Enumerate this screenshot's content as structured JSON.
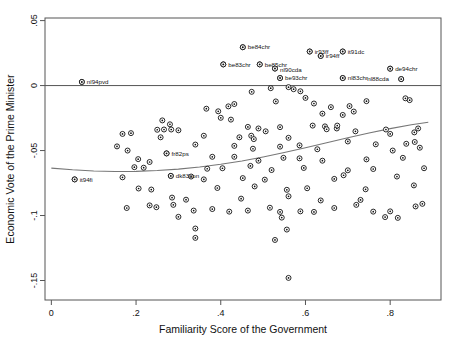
{
  "chart_data": {
    "type": "scatter",
    "title": "",
    "xlabel": "Familiarity Score of the Government",
    "ylabel": "Economic Vote of the Prime Minister",
    "xlim": [
      -0.015,
      0.92
    ],
    "ylim": [
      -0.165,
      0.052
    ],
    "grid": false,
    "legend": null,
    "xticks": [
      0,
      0.2,
      0.4,
      0.6,
      0.8
    ],
    "xticklabels": [
      "0",
      ".2",
      ".4",
      ".6",
      ".8"
    ],
    "yticks": [
      0.05,
      0,
      -0.05,
      -0.1,
      -0.15
    ],
    "yticklabels": [
      ".05",
      "0",
      "-.05",
      "-.1",
      "-.15"
    ],
    "zero_reference_line": 0,
    "marker": "open-circle-dark-center",
    "fit_line": {
      "name": "lowess-fit",
      "points": [
        [
          0.0,
          -0.0635
        ],
        [
          0.05,
          -0.0648
        ],
        [
          0.1,
          -0.0657
        ],
        [
          0.15,
          -0.0661
        ],
        [
          0.2,
          -0.066
        ],
        [
          0.25,
          -0.0654
        ],
        [
          0.3,
          -0.0643
        ],
        [
          0.35,
          -0.0627
        ],
        [
          0.4,
          -0.0606
        ],
        [
          0.45,
          -0.058
        ],
        [
          0.5,
          -0.0549
        ],
        [
          0.55,
          -0.0515
        ],
        [
          0.6,
          -0.0478
        ],
        [
          0.65,
          -0.044
        ],
        [
          0.7,
          -0.0402
        ],
        [
          0.75,
          -0.0365
        ],
        [
          0.8,
          -0.0331
        ],
        [
          0.85,
          -0.0302
        ],
        [
          0.89,
          -0.0282
        ]
      ]
    },
    "labeled_points": [
      {
        "label": "be84chr",
        "x": 0.452,
        "y": 0.0295,
        "label_dx": 5,
        "label_dy": 2.2
      },
      {
        "label": "ir93ff",
        "x": 0.61,
        "y": 0.0262,
        "label_dx": 5,
        "label_dy": 2.2
      },
      {
        "label": "ir94ff",
        "x": 0.636,
        "y": 0.0228,
        "label_dx": 5,
        "label_dy": 2.2
      },
      {
        "label": "it91dc",
        "x": 0.688,
        "y": 0.0262,
        "label_dx": 5,
        "label_dy": 2.2
      },
      {
        "label": "be83chr",
        "x": 0.406,
        "y": 0.0163,
        "label_dx": 5,
        "label_dy": 2.2
      },
      {
        "label": "be85chr",
        "x": 0.492,
        "y": 0.0163,
        "label_dx": 5,
        "label_dy": 2.2
      },
      {
        "label": "nl90cda",
        "x": 0.528,
        "y": 0.0131,
        "label_dx": 5,
        "label_dy": 3.4
      },
      {
        "label": "de94chr",
        "x": 0.8,
        "y": 0.013,
        "label_dx": 5,
        "label_dy": 2.2
      },
      {
        "label": "be93chr",
        "x": 0.54,
        "y": 0.0058,
        "label_dx": 5,
        "label_dy": 2.2
      },
      {
        "label": "nl83chr",
        "x": 0.688,
        "y": 0.0058,
        "label_dx": 5,
        "label_dy": 2.2
      },
      {
        "label": "nl88cda",
        "x": 0.826,
        "y": 0.005,
        "label_dx": -34,
        "label_dy": 2.2
      },
      {
        "label": "nl94pvd",
        "x": 0.072,
        "y": 0.0028,
        "label_dx": 5,
        "label_dy": 2.2
      },
      {
        "label": "fr82ps",
        "x": 0.272,
        "y": -0.0522,
        "label_dx": 5,
        "label_dy": 2.2
      },
      {
        "label": "dk83con",
        "x": 0.282,
        "y": -0.0695,
        "label_dx": 5,
        "label_dy": 2.2
      },
      {
        "label": "it94fi",
        "x": 0.055,
        "y": -0.0722,
        "label_dx": 5,
        "label_dy": 2.2
      }
    ],
    "points": [
      [
        0.452,
        0.0295
      ],
      [
        0.61,
        0.0262
      ],
      [
        0.636,
        0.0228
      ],
      [
        0.688,
        0.0262
      ],
      [
        0.406,
        0.0163
      ],
      [
        0.492,
        0.0163
      ],
      [
        0.528,
        0.0131
      ],
      [
        0.8,
        0.013
      ],
      [
        0.54,
        0.0058
      ],
      [
        0.688,
        0.0058
      ],
      [
        0.826,
        0.005
      ],
      [
        0.072,
        0.0028
      ],
      [
        0.272,
        -0.0522
      ],
      [
        0.282,
        -0.0695
      ],
      [
        0.055,
        -0.0722
      ],
      [
        0.518,
        -0.002
      ],
      [
        0.56,
        -0.0012
      ],
      [
        0.572,
        -0.0028
      ],
      [
        0.588,
        -0.0044
      ],
      [
        0.473,
        -0.0048
      ],
      [
        0.6,
        -0.0095
      ],
      [
        0.53,
        -0.0122
      ],
      [
        0.366,
        -0.0178
      ],
      [
        0.394,
        -0.0198
      ],
      [
        0.418,
        -0.016
      ],
      [
        0.432,
        -0.0142
      ],
      [
        0.62,
        -0.0138
      ],
      [
        0.66,
        -0.0166
      ],
      [
        0.704,
        -0.0158
      ],
      [
        0.744,
        -0.012
      ],
      [
        0.836,
        -0.0098
      ],
      [
        0.846,
        -0.0112
      ],
      [
        0.4,
        -0.0248
      ],
      [
        0.64,
        -0.0216
      ],
      [
        0.688,
        -0.0226
      ],
      [
        0.714,
        -0.02
      ],
      [
        0.424,
        -0.0262
      ],
      [
        0.262,
        -0.0268
      ],
      [
        0.28,
        -0.0298
      ],
      [
        0.25,
        -0.034
      ],
      [
        0.266,
        -0.0338
      ],
      [
        0.283,
        -0.0338
      ],
      [
        0.3,
        -0.0344
      ],
      [
        0.464,
        -0.0318
      ],
      [
        0.489,
        -0.033
      ],
      [
        0.506,
        -0.0352
      ],
      [
        0.54,
        -0.032
      ],
      [
        0.617,
        -0.0308
      ],
      [
        0.646,
        -0.0314
      ],
      [
        0.65,
        -0.0336
      ],
      [
        0.674,
        -0.033
      ],
      [
        0.675,
        -0.0308
      ],
      [
        0.718,
        -0.0352
      ],
      [
        0.79,
        -0.0338
      ],
      [
        0.8,
        -0.0372
      ],
      [
        0.857,
        -0.036
      ],
      [
        0.866,
        -0.033
      ],
      [
        0.168,
        -0.0372
      ],
      [
        0.188,
        -0.0366
      ],
      [
        0.258,
        -0.0398
      ],
      [
        0.36,
        -0.0386
      ],
      [
        0.444,
        -0.0398
      ],
      [
        0.472,
        -0.0386
      ],
      [
        0.478,
        -0.0412
      ],
      [
        0.56,
        -0.0402
      ],
      [
        0.7,
        -0.043
      ],
      [
        0.766,
        -0.0452
      ],
      [
        0.838,
        -0.0448
      ],
      [
        0.858,
        -0.0434
      ],
      [
        0.155,
        -0.0468
      ],
      [
        0.18,
        -0.05
      ],
      [
        0.34,
        -0.0454
      ],
      [
        0.432,
        -0.0464
      ],
      [
        0.476,
        -0.0486
      ],
      [
        0.54,
        -0.047
      ],
      [
        0.586,
        -0.046
      ],
      [
        0.628,
        -0.049
      ],
      [
        0.806,
        -0.05
      ],
      [
        0.87,
        -0.0478
      ],
      [
        0.205,
        -0.0566
      ],
      [
        0.232,
        -0.0588
      ],
      [
        0.38,
        -0.0548
      ],
      [
        0.432,
        -0.0548
      ],
      [
        0.489,
        -0.0578
      ],
      [
        0.548,
        -0.0556
      ],
      [
        0.586,
        -0.056
      ],
      [
        0.64,
        -0.0578
      ],
      [
        0.744,
        -0.0568
      ],
      [
        0.83,
        -0.0556
      ],
      [
        0.196,
        -0.0628
      ],
      [
        0.218,
        -0.0632
      ],
      [
        0.368,
        -0.064
      ],
      [
        0.404,
        -0.0636
      ],
      [
        0.47,
        -0.0618
      ],
      [
        0.52,
        -0.065
      ],
      [
        0.596,
        -0.0634
      ],
      [
        0.7,
        -0.0652
      ],
      [
        0.76,
        -0.0642
      ],
      [
        0.88,
        -0.0636
      ],
      [
        0.168,
        -0.0706
      ],
      [
        0.33,
        -0.07
      ],
      [
        0.36,
        -0.0722
      ],
      [
        0.452,
        -0.0712
      ],
      [
        0.504,
        -0.0724
      ],
      [
        0.668,
        -0.0718
      ],
      [
        0.69,
        -0.069
      ],
      [
        0.816,
        -0.07
      ],
      [
        0.206,
        -0.0792
      ],
      [
        0.236,
        -0.08
      ],
      [
        0.392,
        -0.0788
      ],
      [
        0.48,
        -0.0776
      ],
      [
        0.556,
        -0.0802
      ],
      [
        0.604,
        -0.079
      ],
      [
        0.742,
        -0.0798
      ],
      [
        0.856,
        -0.0768
      ],
      [
        0.285,
        -0.0862
      ],
      [
        0.318,
        -0.0878
      ],
      [
        0.448,
        -0.087
      ],
      [
        0.56,
        -0.0852
      ],
      [
        0.636,
        -0.0884
      ],
      [
        0.73,
        -0.088
      ],
      [
        0.178,
        -0.0942
      ],
      [
        0.232,
        -0.0922
      ],
      [
        0.248,
        -0.0936
      ],
      [
        0.288,
        -0.0918
      ],
      [
        0.336,
        -0.0962
      ],
      [
        0.38,
        -0.095
      ],
      [
        0.42,
        -0.097
      ],
      [
        0.464,
        -0.0962
      ],
      [
        0.516,
        -0.094
      ],
      [
        0.54,
        -0.0972
      ],
      [
        0.588,
        -0.0968
      ],
      [
        0.62,
        -0.0972
      ],
      [
        0.668,
        -0.0942
      ],
      [
        0.72,
        -0.0918
      ],
      [
        0.76,
        -0.097
      ],
      [
        0.8,
        -0.0968
      ],
      [
        0.86,
        -0.093
      ],
      [
        0.876,
        -0.091
      ],
      [
        0.3,
        -0.101
      ],
      [
        0.544,
        -0.1016
      ],
      [
        0.788,
        -0.1012
      ],
      [
        0.818,
        -0.1018
      ],
      [
        0.34,
        -0.11
      ],
      [
        0.34,
        -0.1172
      ],
      [
        0.556,
        -0.1108
      ],
      [
        0.528,
        -0.1188
      ],
      [
        0.56,
        -0.148
      ]
    ]
  }
}
